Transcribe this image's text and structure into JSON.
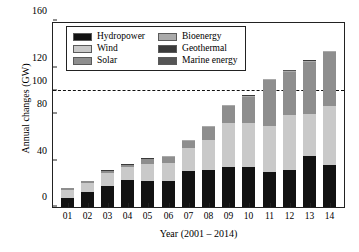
{
  "chart_data": {
    "type": "bar",
    "stacked": true,
    "title": "",
    "xlabel": "Year (2001 – 2014)",
    "ylabel": "Annual changes (GW)",
    "categories": [
      "01",
      "02",
      "03",
      "04",
      "05",
      "06",
      "07",
      "08",
      "09",
      "10",
      "11",
      "12",
      "13",
      "14"
    ],
    "ylim": [
      0,
      160
    ],
    "yticks": [
      0,
      40,
      80,
      100,
      120,
      160
    ],
    "ytick_labels": [
      "0",
      "40",
      "80",
      "100",
      "120",
      "160"
    ],
    "grid": false,
    "legend_position": "upper-left-inside",
    "reference_line": {
      "value": 100,
      "style": "dashed",
      "color": "#111111"
    },
    "series": [
      {
        "name": "Hydropower",
        "color": "#121212",
        "values": [
          8,
          13,
          18,
          23,
          22,
          22,
          31,
          32,
          34,
          34,
          30,
          32,
          44,
          36
        ]
      },
      {
        "name": "Wind",
        "color": "#c9c9c9",
        "values": [
          7,
          8,
          11,
          11,
          15,
          16,
          20,
          26,
          38,
          38,
          40,
          47,
          36,
          51
        ]
      },
      {
        "name": "Solar",
        "color": "#8e8e8e",
        "values": [
          1,
          1,
          2,
          2,
          4,
          5,
          6,
          11,
          15,
          23,
          39,
          37,
          45,
          46
        ]
      },
      {
        "name": "Bioenergy",
        "color": "#aaaaaa",
        "values": [
          0.4,
          0.4,
          0.4,
          0.5,
          0.5,
          0.6,
          0.6,
          0.7,
          0.8,
          0.9,
          1.0,
          1.0,
          1.0,
          1.0
        ]
      },
      {
        "name": "Geothermal",
        "color": "#3a3a3a",
        "values": [
          0.3,
          0.3,
          0.3,
          0.3,
          0.3,
          0.3,
          0.3,
          0.3,
          0.3,
          0.4,
          0.4,
          0.4,
          0.4,
          0.4
        ]
      },
      {
        "name": "Marine energy",
        "color": "#555555",
        "values": [
          0.1,
          0.1,
          0.1,
          0.1,
          0.1,
          0.1,
          0.1,
          0.1,
          0.1,
          0.1,
          0.1,
          0.1,
          0.1,
          0.1
        ]
      }
    ],
    "totals": [
      16.8,
      22.8,
      31.8,
      36.9,
      41.9,
      44.0,
      58.0,
      70.1,
      88.2,
      96.4,
      110.5,
      117.5,
      126.5,
      134.5
    ]
  },
  "legend": {
    "columns": [
      [
        {
          "label": "Hydropower",
          "color": "#121212"
        },
        {
          "label": "Wind",
          "color": "#c9c9c9"
        },
        {
          "label": "Solar",
          "color": "#8e8e8e"
        }
      ],
      [
        {
          "label": "Bioenergy",
          "color": "#aaaaaa"
        },
        {
          "label": "Geothermal",
          "color": "#3a3a3a"
        },
        {
          "label": "Marine energy",
          "color": "#555555"
        }
      ]
    ]
  },
  "axes": {
    "y_title": "Annual changes (GW)",
    "x_title": "Year (2001 – 2014)"
  }
}
